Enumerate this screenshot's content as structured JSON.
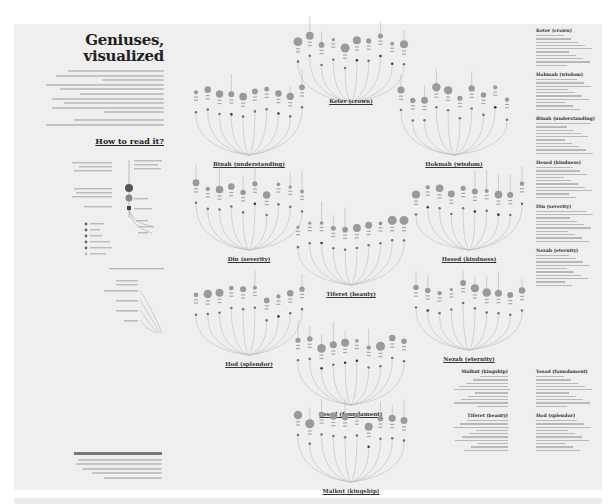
{
  "intro": {
    "title_line1": "Geniuses,",
    "title_line2": "visualized",
    "description_line_count": 10,
    "source_line_count": 2
  },
  "how_to_read": {
    "title": "How to read it?"
  },
  "charts": [
    {
      "id": "keter",
      "label": "Keter (crown)"
    },
    {
      "id": "binah",
      "label": "Binah (understanding)"
    },
    {
      "id": "hokmah",
      "label": "Hokmah (wisdom)"
    },
    {
      "id": "din",
      "label": "Din (severity)"
    },
    {
      "id": "hesed",
      "label": "Hesed (kindness)"
    },
    {
      "id": "tiferet",
      "label": "Tiferet (beauty)"
    },
    {
      "id": "hod",
      "label": "Hod (splendor)"
    },
    {
      "id": "nezah",
      "label": "Nezah (eternity)"
    },
    {
      "id": "yesod",
      "label": "Yesod (foundament)"
    },
    {
      "id": "malkut",
      "label": "Malkut (kingship)"
    }
  ],
  "lists": {
    "right_column": [
      {
        "title": "Keter (crown)",
        "rows": 10
      },
      {
        "title": "Hokmah (wisdom)",
        "rows": 10
      },
      {
        "title": "Binah (understanding)",
        "rows": 10
      },
      {
        "title": "Hesed (kindness)",
        "rows": 10
      },
      {
        "title": "Din (severity)",
        "rows": 10
      },
      {
        "title": "Nezah (eternity)",
        "rows": 10
      }
    ],
    "bottom_left": [
      {
        "title": "Malkut (kingship)",
        "rows": 10
      },
      {
        "title": "Tiferet (beauty)",
        "rows": 10
      }
    ],
    "bottom_right": [
      {
        "title": "Yesod (foundament)",
        "rows": 10
      },
      {
        "title": "Hod (splendor)",
        "rows": 10
      }
    ]
  },
  "credit": {
    "line_count": 5
  },
  "colors": {
    "background": "#efefef",
    "arc": "#bdbdbd",
    "node_fill": "#9a9a9a",
    "node_dark": "#3a3a3a",
    "text": "#333333"
  }
}
